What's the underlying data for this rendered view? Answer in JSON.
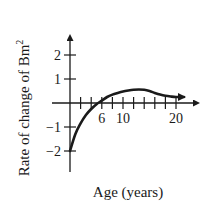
{
  "chart_data": {
    "type": "line",
    "title": "",
    "xlabel": "Age (years)",
    "ylabel": "Rate of change of Bm²",
    "ylabel_main": "Rate of change of Bm",
    "ylabel_sup": "2",
    "xlim": [
      0,
      22
    ],
    "ylim": [
      -2.8,
      2.8
    ],
    "x_tick_labels": [
      "6",
      "10",
      "20"
    ],
    "x_tick_label_values": [
      6,
      10,
      20
    ],
    "x_minor_ticks": [
      2,
      4,
      6,
      8,
      10,
      12,
      14,
      16,
      18,
      20
    ],
    "y_tick_labels": [
      "2",
      "1",
      "−1",
      "−2"
    ],
    "y_tick_values": [
      2,
      1,
      -1,
      -2
    ],
    "grid": false,
    "legend": null,
    "series": [
      {
        "name": "Rate of change of Bm²",
        "x": [
          0,
          1,
          2,
          3,
          4,
          5,
          6,
          7,
          8,
          9,
          10,
          11,
          12,
          13,
          14,
          15,
          16,
          17,
          18,
          19,
          20,
          21.5
        ],
        "y": [
          -2.0,
          -1.3,
          -0.85,
          -0.5,
          -0.25,
          -0.05,
          0.1,
          0.25,
          0.35,
          0.42,
          0.48,
          0.52,
          0.55,
          0.56,
          0.55,
          0.5,
          0.42,
          0.35,
          0.3,
          0.27,
          0.25,
          0.25
        ],
        "end_arrow": true
      }
    ]
  }
}
